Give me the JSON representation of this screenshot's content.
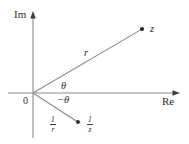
{
  "figure": {
    "background_color": "#ffffff",
    "line_color": "#808080",
    "text_color": "#2b2b2b",
    "width": 189,
    "height": 144
  },
  "axes": {
    "imaginary_label": "Im",
    "real_label": "Re",
    "origin_label": "0"
  },
  "labels": {
    "modulus": "r",
    "angle_positive": "θ",
    "angle_negative": "−θ",
    "point_z": "z",
    "inverse_modulus_num": "1",
    "inverse_modulus_den": "r",
    "inverse_point_num": "1",
    "inverse_point_den": "z"
  },
  "geometry": {
    "origin": {
      "x": 33,
      "y": 93
    },
    "vertical_axis": {
      "x": 33,
      "y_top": 12,
      "y_bottom": 138
    },
    "horizontal_axis": {
      "y": 93,
      "x_left": 8,
      "x_right": 180
    },
    "ray_z": {
      "x1": 33,
      "y1": 93,
      "x2": 142,
      "y2": 29
    },
    "ray_inverse_z": {
      "x1": 33,
      "y1": 93,
      "x2": 78,
      "y2": 122
    },
    "point_z": {
      "x": 142,
      "y": 29
    },
    "point_inverse_z": {
      "x": 78,
      "y": 122
    }
  }
}
